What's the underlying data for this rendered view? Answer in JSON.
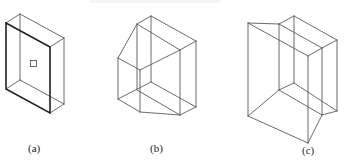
{
  "figures": [
    {
      "id": "a",
      "label": "(a)",
      "description": "Rectangular box with bold front face and small square marker"
    },
    {
      "id": "b",
      "label": "(b)",
      "description": "Box with one vertical edge chamfered (beveled)"
    },
    {
      "id": "c",
      "label": "(c)",
      "description": "Box with skewed/sheared corner wedge"
    }
  ],
  "colors": {
    "line": "#5a5a5a",
    "bold_line": "#222222",
    "background": "#ffffff"
  }
}
